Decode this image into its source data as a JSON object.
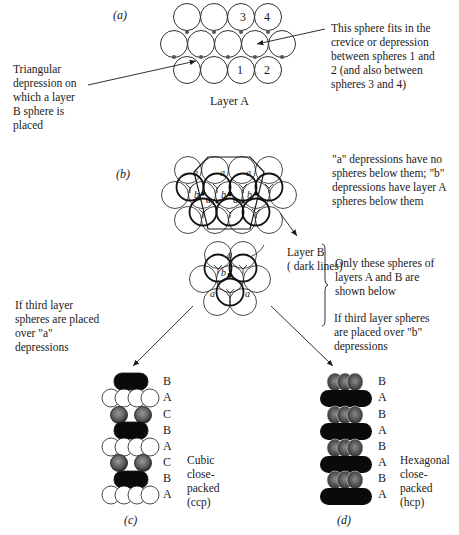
{
  "panels": {
    "a": {
      "label": "(a)",
      "caption": "Layer A",
      "sphere_numbers": [
        "1",
        "2",
        "3",
        "4"
      ],
      "left_note": "Triangular\ndepression on\nwhich a layer\nB sphere is\nplaced",
      "right_note": "This sphere fits in the\ncrevice or depression\nbetween spheres 1 and\n2 (and also between\nspheres 3 and 4)"
    },
    "b": {
      "label": "(b)",
      "depression_note": "\"a\" depressions have no\nspheres below them; \"b\"\ndepressions have layer A\nspheres below them",
      "layer_b_note": "Layer B\n( dark lines)",
      "shown_below_note": "Only these spheres of\nlayers A and B are\nshown below",
      "left_branch_note": "If third layer\nspheres are placed\nover \"a\"\ndepressions",
      "right_branch_note": "If third layer spheres\nare placed over \"b\"\ndepressions",
      "depression_labels": [
        "a",
        "b"
      ]
    },
    "c": {
      "label": "(c)",
      "caption": "Cubic\nclose-\npacked\n(ccp)",
      "layers": [
        "B",
        "A",
        "C",
        "B",
        "A",
        "C",
        "B",
        "A"
      ]
    },
    "d": {
      "label": "(d)",
      "caption": "Hexagonal\nclose-\npacked\n(hcp)",
      "layers": [
        "B",
        "A",
        "B",
        "A",
        "B",
        "A",
        "B",
        "A"
      ]
    }
  },
  "colors": {
    "line": "#1a1a1a",
    "sphere_white": "#ffffff",
    "sphere_black": "#0a0a0a",
    "sphere_gray": "#6a6a6a"
  }
}
